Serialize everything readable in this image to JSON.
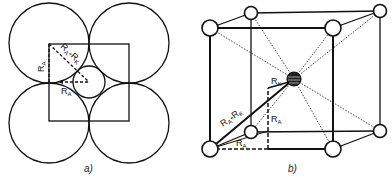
{
  "figure": {
    "panel_a": {
      "caption": "a)",
      "labels": {
        "ra_vertical": "R",
        "ra_vertical_sub": "A",
        "diag_main": "R",
        "diag_sub_a": "A",
        "diag_plus": "+",
        "diag_main2": "R",
        "diag_sub_k": "K",
        "ra_horizontal": "R",
        "ra_horizontal_sub": "A"
      }
    },
    "panel_b": {
      "caption": "b)",
      "labels": {
        "rk_top": "R",
        "rk_top_sub": "K",
        "diag_main": "R",
        "diag_sub_a": "A",
        "diag_plus": "+",
        "diag_main2": "R",
        "diag_sub_k": "K",
        "ra_vertical": "R",
        "ra_vertical_sub": "A",
        "ra_bottom": "R",
        "ra_bottom_sub": "A"
      }
    }
  }
}
